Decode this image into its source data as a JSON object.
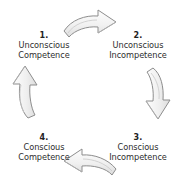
{
  "diagram": {
    "direction": "clockwise",
    "background_color": "#ffffff",
    "text_color": "#2b2b2b",
    "arrow_fill_color": "#f2f2f2",
    "arrow_stroke_color": "#8f8f8f",
    "stages": [
      {
        "number": "1.",
        "line1": "Unconscious",
        "line2": "Competence",
        "position": "top-left"
      },
      {
        "number": "2.",
        "line1": "Unconscious",
        "line2": "Incompetence",
        "position": "top-right"
      },
      {
        "number": "3.",
        "line1": "Conscious",
        "line2": "Incompetence",
        "position": "bottom-right"
      },
      {
        "number": "4.",
        "line1": "Conscious",
        "line2": "Competence",
        "position": "bottom-left"
      }
    ],
    "arrows": [
      {
        "name": "arrow-right-top",
        "direction": "right",
        "from": "1",
        "to": "2"
      },
      {
        "name": "arrow-down-right",
        "direction": "down",
        "from": "2",
        "to": "3"
      },
      {
        "name": "arrow-left-bottom",
        "direction": "left",
        "from": "3",
        "to": "4"
      },
      {
        "name": "arrow-up-left",
        "direction": "up",
        "from": "4",
        "to": "1"
      }
    ]
  }
}
